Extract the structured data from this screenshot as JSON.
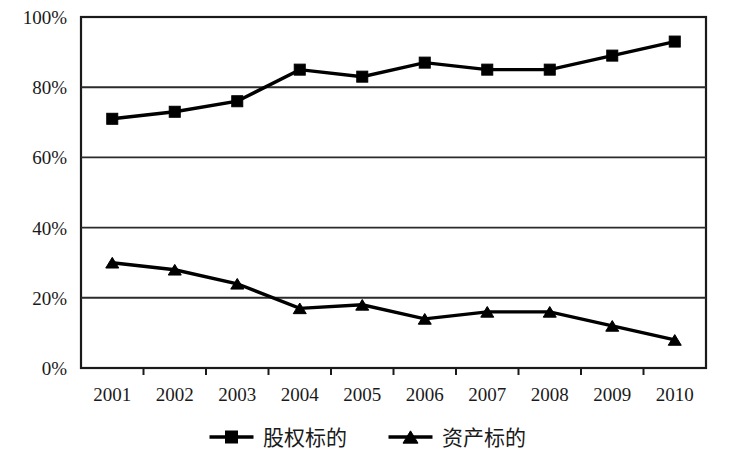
{
  "chart_data": {
    "type": "line",
    "title": "",
    "subtitle": "",
    "xlabel": "",
    "ylabel": "",
    "categories": [
      "2001",
      "2002",
      "2003",
      "2004",
      "2005",
      "2006",
      "2007",
      "2008",
      "2009",
      "2010"
    ],
    "series": [
      {
        "name": "股权标的",
        "marker": "square",
        "color": "#000000",
        "values": [
          71,
          73,
          76,
          85,
          83,
          87,
          85,
          85,
          89,
          93
        ]
      },
      {
        "name": "资产标的",
        "marker": "triangle",
        "color": "#000000",
        "values": [
          30,
          28,
          24,
          17,
          18,
          14,
          16,
          16,
          12,
          8
        ]
      }
    ],
    "ylim": [
      0,
      100
    ],
    "ytick_labels": [
      "0%",
      "20%",
      "40%",
      "60%",
      "80%",
      "100%"
    ],
    "ytick_values": [
      0,
      20,
      40,
      60,
      80,
      100
    ],
    "grid": true,
    "grid_axis": "y",
    "legend_position": "bottom"
  },
  "legend": {
    "items": [
      {
        "label": "股权标的",
        "marker": "square-marker-icon"
      },
      {
        "label": "资产标的",
        "marker": "triangle-marker-icon"
      }
    ]
  },
  "colors": {
    "line": "#000000",
    "grid": "#2b2b2b",
    "frame": "#1a1a1a",
    "text": "#1a1a1a",
    "background": "#ffffff"
  }
}
